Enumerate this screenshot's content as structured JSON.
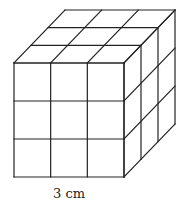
{
  "diagram": {
    "type": "cube-of-unit-cubes",
    "grid": 3,
    "stroke_color": "#222222",
    "background": "#ffffff",
    "front_face": {
      "x0": 14,
      "y0": 63,
      "x1": 124,
      "y1": 177
    },
    "depth_offset": {
      "dx": 51,
      "dy": -53
    },
    "label": {
      "text": "3 cm",
      "x": 53,
      "y": 186
    }
  }
}
